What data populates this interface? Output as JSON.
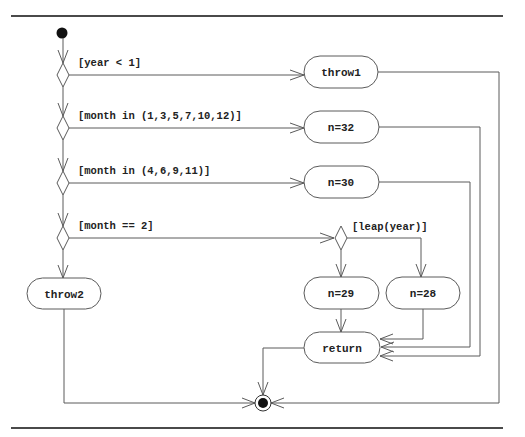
{
  "diagram": {
    "type": "UML activity diagram",
    "guards": {
      "year_lt_1": "[year < 1]",
      "month_31": "[month in (1,3,5,7,10,12)]",
      "month_30": "[month in (4,6,9,11)]",
      "month_feb": "[month == 2]",
      "leap_year": "[leap(year)]"
    },
    "actions": {
      "throw1": "throw1",
      "n32": "n=32",
      "n30": "n=30",
      "throw2": "throw2",
      "n29": "n=29",
      "n28": "n=28",
      "return": "return"
    },
    "colors": {
      "line": "#5a5a5a",
      "text": "#222222",
      "rule": "#4a4a4a"
    }
  }
}
